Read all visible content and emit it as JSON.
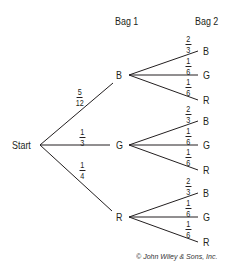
{
  "headers": {
    "bag1": "Bag 1",
    "bag2": "Bag 2"
  },
  "root": {
    "label": "Start"
  },
  "level1": [
    {
      "label": "B",
      "prob": {
        "num": "5",
        "den": "12"
      }
    },
    {
      "label": "G",
      "prob": {
        "num": "1",
        "den": "3"
      }
    },
    {
      "label": "R",
      "prob": {
        "num": "1",
        "den": "4"
      }
    }
  ],
  "level2": [
    {
      "parent": "B",
      "children": [
        {
          "label": "B",
          "prob": {
            "num": "2",
            "den": "3"
          }
        },
        {
          "label": "G",
          "prob": {
            "num": "1",
            "den": "6"
          }
        },
        {
          "label": "R",
          "prob": {
            "num": "1",
            "den": "6"
          }
        }
      ]
    },
    {
      "parent": "G",
      "children": [
        {
          "label": "B",
          "prob": {
            "num": "2",
            "den": "3"
          }
        },
        {
          "label": "G",
          "prob": {
            "num": "1",
            "den": "6"
          }
        },
        {
          "label": "R",
          "prob": {
            "num": "1",
            "den": "6"
          }
        }
      ]
    },
    {
      "parent": "R",
      "children": [
        {
          "label": "B",
          "prob": {
            "num": "2",
            "den": "3"
          }
        },
        {
          "label": "G",
          "prob": {
            "num": "1",
            "den": "6"
          }
        },
        {
          "label": "R",
          "prob": {
            "num": "1",
            "den": "6"
          }
        }
      ]
    }
  ],
  "copyright": "© John Wiley & Sons, Inc.",
  "colors": {
    "ink": "#231f20",
    "background": "#ffffff"
  }
}
